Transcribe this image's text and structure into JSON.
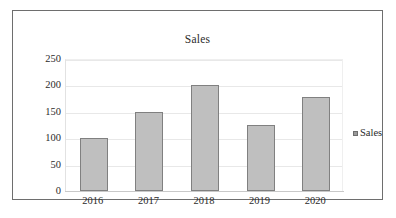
{
  "chart_data": {
    "type": "bar",
    "title": "Sales",
    "categories": [
      "2016",
      "2017",
      "2018",
      "2019",
      "2020"
    ],
    "values": [
      100,
      150,
      200,
      125,
      178
    ],
    "series": [
      {
        "name": "Sales",
        "values": [
          100,
          150,
          200,
          125,
          178
        ]
      }
    ],
    "xlabel": "",
    "ylabel": "",
    "ylim": [
      0,
      250
    ],
    "yticks": [
      0,
      50,
      100,
      150,
      200,
      250
    ],
    "ytick_labels": [
      "0",
      "50",
      "100",
      "150",
      "200",
      "250"
    ],
    "grid": true,
    "legend": {
      "position": "right",
      "entries": [
        "Sales"
      ],
      "marker": "square-marker"
    },
    "colors": {
      "bar_fill": "#bfbfbf",
      "bar_border": "#808080",
      "gridline": "#e8e8e8",
      "axis_text": "#2b2b2b",
      "frame_border": "#6e6e6e",
      "background": "#ffffff"
    }
  }
}
